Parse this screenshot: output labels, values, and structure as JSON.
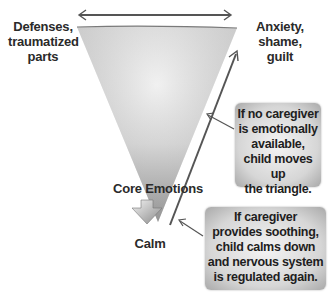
{
  "diagram": {
    "triangle": {
      "top_left_label": [
        "Defenses,",
        "traumatized",
        "parts"
      ],
      "top_right_label": [
        "Anxiety,",
        "shame,",
        "guilt"
      ],
      "bottom_label": "Core Emotions"
    },
    "down_arrow_label": "Calm",
    "callouts": [
      {
        "id": "no-caregiver",
        "lines": [
          "If no caregiver",
          "is emotionally",
          "available,",
          "child moves up",
          "the triangle."
        ]
      },
      {
        "id": "caregiver-soothing",
        "lines": [
          "If caregiver",
          "provides soothing,",
          "child calms down",
          "and nervous system",
          "is regulated again."
        ]
      }
    ],
    "colors": {
      "triangle_fill": "#d9d9d9",
      "arrow_stroke": "#555555",
      "text": "#2a2a2a",
      "callout_bg": "#d6d6d6"
    }
  }
}
